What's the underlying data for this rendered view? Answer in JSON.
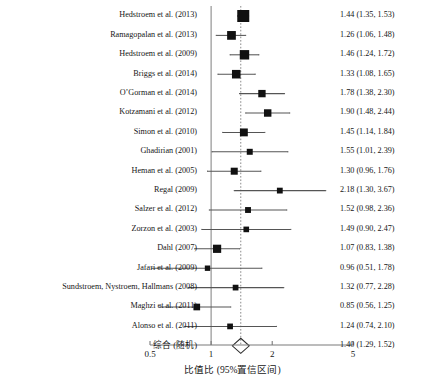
{
  "chart_data": {
    "type": "forest",
    "title": "",
    "xlabel": "比值比 (95%置信区间)",
    "ylabel": "",
    "xscale": "log",
    "xlim": [
      0.5,
      5
    ],
    "ticks": [
      0.5,
      1,
      2,
      5
    ],
    "tick_labels": [
      "0.5",
      "1",
      "2",
      "5"
    ],
    "null_line": 1,
    "pooled_line": 1.4,
    "grid": false,
    "legend": "none",
    "studies": [
      {
        "label": "Hedstroem et al. (2013)",
        "est": 1.44,
        "lo": 1.35,
        "hi": 1.53,
        "text": "1.44 (1.35, 1.53)",
        "weight": 1.0
      },
      {
        "label": "Ramagopalan et al. (2013)",
        "est": 1.26,
        "lo": 1.06,
        "hi": 1.48,
        "text": "1.26 (1.06, 1.48)",
        "weight": 0.62
      },
      {
        "label": "Hedstroem et al. (2009)",
        "est": 1.46,
        "lo": 1.24,
        "hi": 1.72,
        "text": "1.46 (1.24, 1.72)",
        "weight": 0.7
      },
      {
        "label": "Briggs et al. (2014)",
        "est": 1.33,
        "lo": 1.08,
        "hi": 1.65,
        "text": "1.33 (1.08, 1.65)",
        "weight": 0.6
      },
      {
        "label": "O’Gorman et al. (2014)",
        "est": 1.78,
        "lo": 1.38,
        "hi": 2.3,
        "text": "1.78 (1.38, 2.30)",
        "weight": 0.46
      },
      {
        "label": "Kotzamani et al. (2012)",
        "est": 1.9,
        "lo": 1.48,
        "hi": 2.44,
        "text": "1.90 (1.48, 2.44)",
        "weight": 0.47
      },
      {
        "label": "Simon et al. (2010)",
        "est": 1.45,
        "lo": 1.14,
        "hi": 1.84,
        "text": "1.45 (1.14, 1.84)",
        "weight": 0.52
      },
      {
        "label": "Ghadirian (2001)",
        "est": 1.55,
        "lo": 1.01,
        "hi": 2.39,
        "text": "1.55 (1.01, 2.39)",
        "weight": 0.3
      },
      {
        "label": "Heman et al. (2005)",
        "est": 1.3,
        "lo": 0.96,
        "hi": 1.76,
        "text": "1.30 (0.96, 1.76)",
        "weight": 0.42
      },
      {
        "label": "Regal (2009)",
        "est": 2.18,
        "lo": 1.3,
        "hi": 3.67,
        "text": "2.18 (1.30, 3.67)",
        "weight": 0.28
      },
      {
        "label": "Salzer et al. (2012)",
        "est": 1.52,
        "lo": 0.98,
        "hi": 2.36,
        "text": "1.52 (0.98, 2.36)",
        "weight": 0.29
      },
      {
        "label": "Zorzon et al. (2003)",
        "est": 1.49,
        "lo": 0.9,
        "hi": 2.47,
        "text": "1.49 (0.90, 2.47)",
        "weight": 0.26
      },
      {
        "label": "Dahl (2007)",
        "est": 1.07,
        "lo": 0.83,
        "hi": 1.38,
        "text": "1.07 (0.83, 1.38)",
        "weight": 0.56
      },
      {
        "label": "Jafari et al. (2009)",
        "est": 0.96,
        "lo": 0.51,
        "hi": 1.78,
        "text": "0.96 (0.51, 1.78)",
        "weight": 0.23
      },
      {
        "label": "Sundstroem, Nystroem, Hallmans (2008)",
        "est": 1.32,
        "lo": 0.77,
        "hi": 2.28,
        "text": "1.32 (0.77, 2.28)",
        "weight": 0.27
      },
      {
        "label": "Maghzi et al. (2011)",
        "est": 0.85,
        "lo": 0.56,
        "hi": 1.25,
        "text": "0.85 (0.56, 1.25)",
        "weight": 0.38
      },
      {
        "label": "Alonso et al. (2011)",
        "est": 1.24,
        "lo": 0.74,
        "hi": 2.1,
        "text": "1.24 (0.74, 2.10)",
        "weight": 0.27
      }
    ],
    "pooled": {
      "label": "综合 (随机)",
      "est": 1.4,
      "lo": 1.29,
      "hi": 1.52,
      "text": "1.40 (1.29, 1.52)"
    },
    "colors": {
      "marker": "#111111",
      "ci_line": "#555555",
      "axis": "#7a7a7a",
      "null_line": "#8a8a8a",
      "pooled_line": "#8a8a8a",
      "text": "#161616",
      "background": "#ffffff"
    }
  }
}
